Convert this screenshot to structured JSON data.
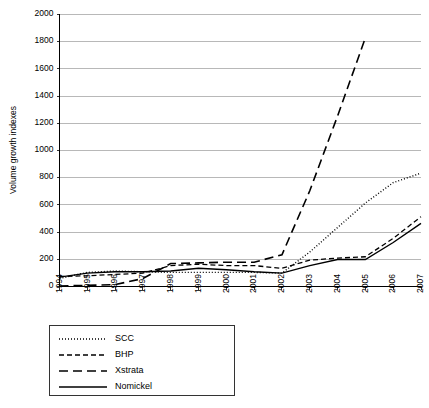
{
  "chart_data": {
    "type": "line",
    "title": "",
    "xlabel": "",
    "ylabel": "Volume growth indexes",
    "categories": [
      "1994",
      "1995",
      "1996",
      "1997",
      "1998",
      "1999",
      "2000",
      "2001",
      "2002",
      "2003",
      "2004",
      "2005",
      "2006",
      "2007"
    ],
    "ylim": [
      0,
      2000
    ],
    "yticks": [
      0,
      200,
      400,
      600,
      800,
      1000,
      1200,
      1400,
      1600,
      1800,
      2000
    ],
    "grid": true,
    "legend_position": "below-left",
    "series": [
      {
        "name": "SCC",
        "style": "dotted",
        "values": [
          55,
          100,
          110,
          105,
          100,
          100,
          100,
          100,
          95,
          250,
          430,
          610,
          760,
          830
        ]
      },
      {
        "name": "BHP",
        "style": "dashed",
        "values": [
          70,
          75,
          85,
          95,
          150,
          160,
          150,
          150,
          130,
          190,
          205,
          215,
          350,
          510
        ]
      },
      {
        "name": "Xstrata",
        "style": "long-dash",
        "values": [
          0,
          5,
          10,
          55,
          165,
          170,
          175,
          175,
          230,
          700,
          1250,
          1825,
          null,
          null
        ]
      },
      {
        "name": "Nomickel",
        "style": "solid",
        "values": [
          65,
          95,
          105,
          105,
          110,
          130,
          120,
          105,
          95,
          150,
          195,
          195,
          320,
          460
        ]
      }
    ]
  },
  "axis": {
    "y_title": "Volume growth indexes"
  },
  "legend": {
    "entries": [
      {
        "label": "SCC"
      },
      {
        "label": "BHP"
      },
      {
        "label": "Xstrata"
      },
      {
        "label": "Nomickel"
      }
    ]
  }
}
